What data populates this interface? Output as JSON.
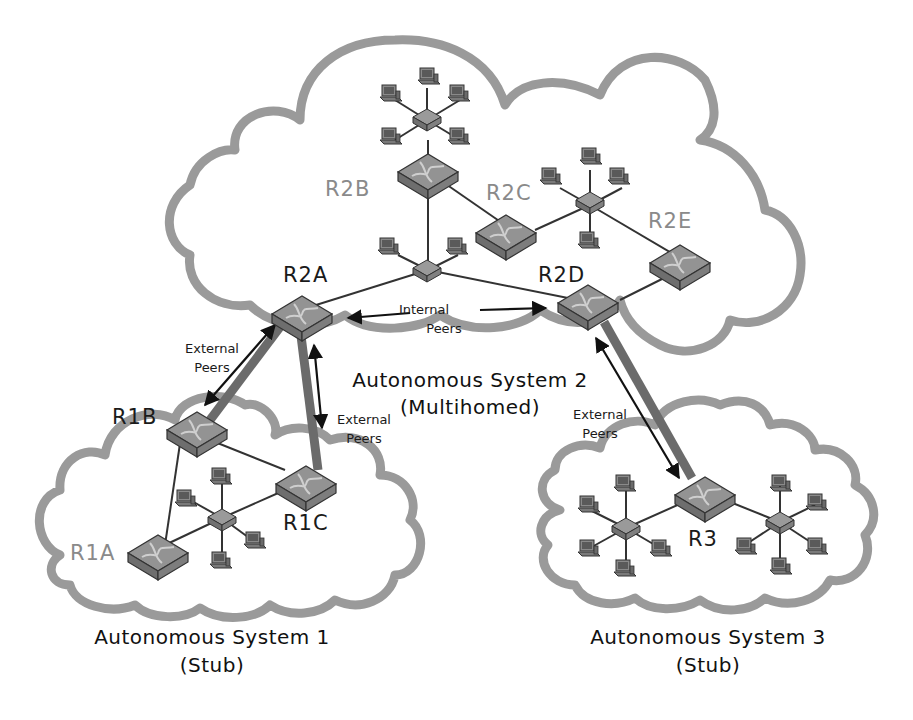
{
  "diagram": {
    "type": "bgp-autonomous-systems-topology",
    "autonomous_systems": [
      {
        "id": "as1",
        "title": "Autonomous System 1",
        "subtitle": "(Stub)",
        "routers": [
          "R1A",
          "R1B",
          "R1C"
        ]
      },
      {
        "id": "as2",
        "title": "Autonomous System 2",
        "subtitle": "(Multihomed)",
        "routers": [
          "R2A",
          "R2B",
          "R2C",
          "R2D",
          "R2E"
        ]
      },
      {
        "id": "as3",
        "title": "Autonomous System 3",
        "subtitle": "(Stub)",
        "routers": [
          "R3"
        ]
      }
    ],
    "routers": {
      "r2a": "R2A",
      "r2b": "R2B",
      "r2c": "R2C",
      "r2d": "R2D",
      "r2e": "R2E",
      "r1a": "R1A",
      "r1b": "R1B",
      "r1c": "R1C",
      "r3": "R3"
    },
    "peer_labels": {
      "internal_line1": "Internal",
      "internal_line2": "Peers",
      "external_line1": "External",
      "external_line2": "Peers"
    },
    "peerings": [
      {
        "type": "internal",
        "from": "R2A",
        "to": "R2D"
      },
      {
        "type": "external",
        "from": "R2A",
        "to": "R1B"
      },
      {
        "type": "external",
        "from": "R2A",
        "to": "R1C"
      },
      {
        "type": "external",
        "from": "R2D",
        "to": "R3"
      }
    ],
    "colors": {
      "cloud_outline": "#9a9a9a",
      "external_link": "#6b6b6b",
      "router_fill": "#8f8f8f",
      "label_border_router": "#8a8a8a",
      "label_core_router": "#1a1a1a"
    }
  }
}
